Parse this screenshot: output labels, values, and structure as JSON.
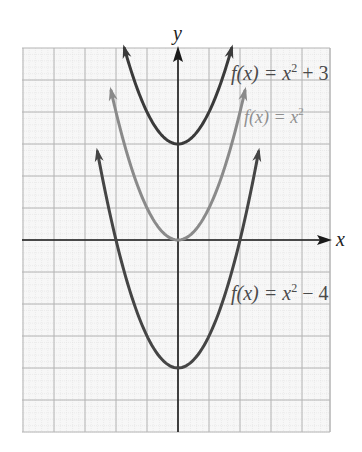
{
  "chart_data": {
    "type": "line",
    "title": "",
    "xlabel": "x",
    "ylabel": "y",
    "xlim": [
      -5,
      5
    ],
    "ylim": [
      -6,
      6
    ],
    "grid": true,
    "grid_step": 1,
    "minor_grid": true,
    "tick_labels": false,
    "series": [
      {
        "name": "f(x) = x^2 + 3",
        "label_parts": {
          "lhs": "f(x) = x",
          "exp": "2",
          "rhs": " + 3"
        },
        "expression": "x^2 + 3",
        "vertex": [
          0,
          3
        ],
        "domain": [
          -1.73,
          1.73
        ],
        "color": "#3a3a3a",
        "arrows": true
      },
      {
        "name": "f(x) = x^2",
        "label_parts": {
          "lhs": "f(x) = x",
          "exp": "2",
          "rhs": ""
        },
        "expression": "x^2",
        "vertex": [
          0,
          0
        ],
        "domain": [
          -2.16,
          2.16
        ],
        "color": "#8a8a8a",
        "arrows": true
      },
      {
        "name": "f(x) = x^2 - 4",
        "label_parts": {
          "lhs": "f(x) = x",
          "exp": "2",
          "rhs": " − 4"
        },
        "expression": "x^2 - 4",
        "vertex": [
          0,
          -4
        ],
        "domain": [
          -2.6,
          2.6
        ],
        "color": "#454545",
        "arrows": true
      }
    ]
  },
  "axes": {
    "x_label": "x",
    "y_label": "y"
  },
  "colors": {
    "grid_major": "#b4b4b4",
    "grid_minor": "#dedede",
    "axis": "#1a1a1a",
    "label_dark": "#4a4a4a",
    "label_gray": "#8f8f8f"
  }
}
